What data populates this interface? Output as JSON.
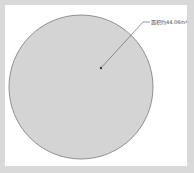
{
  "diagram": {
    "shape": "circle",
    "fill_color": "#d4d4d4",
    "stroke_color": "#7a7a7a",
    "annotation": {
      "label": "面积约44.06m²"
    }
  }
}
